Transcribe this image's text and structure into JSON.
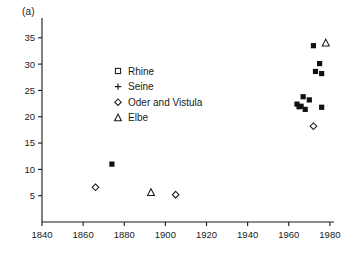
{
  "panel": {
    "label": "(a)"
  },
  "chart_data": {
    "type": "scatter",
    "title": "",
    "subtitle": "",
    "xlabel": "",
    "ylabel": "",
    "xlim": [
      1840,
      1982
    ],
    "ylim": [
      0,
      38
    ],
    "xticks": [
      1840,
      1860,
      1880,
      1900,
      1920,
      1940,
      1960,
      1980
    ],
    "xtick_labels": [
      "1840",
      "1860",
      "1880",
      "1900",
      "1920",
      "1940",
      "1960",
      "1980"
    ],
    "yticks": [
      5,
      10,
      15,
      20,
      25,
      30,
      35
    ],
    "ytick_labels": [
      "5",
      "10",
      "15",
      "20",
      "25",
      "30",
      "35"
    ],
    "grid": false,
    "legend_position": "upper-center-left",
    "series": [
      {
        "name": "Rhine",
        "marker": "square",
        "filled": true,
        "legend_marker": "square-open",
        "points": [
          {
            "x": 1874,
            "y": 11.0
          },
          {
            "x": 1964,
            "y": 22.4
          },
          {
            "x": 1965,
            "y": 21.9
          },
          {
            "x": 1966,
            "y": 22.0
          },
          {
            "x": 1967,
            "y": 23.8
          },
          {
            "x": 1968,
            "y": 21.4
          },
          {
            "x": 1970,
            "y": 23.2
          },
          {
            "x": 1972,
            "y": 33.5
          },
          {
            "x": 1973,
            "y": 28.6
          },
          {
            "x": 1975,
            "y": 30.1
          },
          {
            "x": 1976,
            "y": 28.2
          },
          {
            "x": 1976,
            "y": 21.8
          }
        ]
      },
      {
        "name": "Seine",
        "marker": "plus",
        "filled": false,
        "legend_marker": "plus",
        "points": [
          {
            "x": 1849,
            "y": 6.8
          },
          {
            "x": 1891,
            "y": 4.0
          },
          {
            "x": 1977,
            "y": 24.0
          }
        ]
      },
      {
        "name": "Oder and Vistula",
        "marker": "diamond",
        "filled": false,
        "legend_marker": "diamond-open",
        "points": [
          {
            "x": 1866,
            "y": 6.6
          },
          {
            "x": 1905,
            "y": 5.2
          },
          {
            "x": 1972,
            "y": 18.2
          }
        ]
      },
      {
        "name": "Elbe",
        "marker": "triangle",
        "filled": false,
        "legend_marker": "triangle-open",
        "points": [
          {
            "x": 1893,
            "y": 5.6
          },
          {
            "x": 1978,
            "y": 34.0
          }
        ]
      }
    ]
  },
  "legend": {
    "entries": [
      {
        "label": "Rhine",
        "marker": "square-open"
      },
      {
        "label": "Seine",
        "marker": "plus"
      },
      {
        "label": "Oder and Vistula",
        "marker": "diamond-open"
      },
      {
        "label": "Elbe",
        "marker": "triangle-open"
      }
    ]
  }
}
